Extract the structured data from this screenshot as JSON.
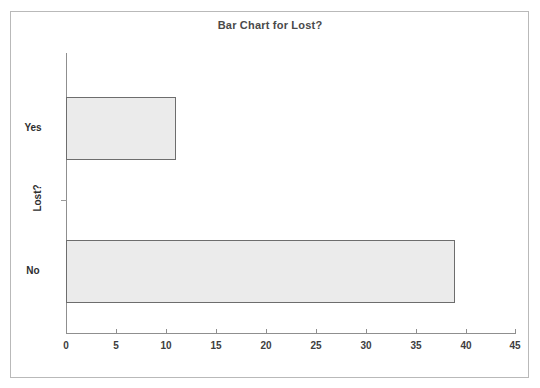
{
  "chart_data": {
    "type": "bar",
    "orientation": "horizontal",
    "title": "Bar Chart for Lost?",
    "xlabel": "",
    "ylabel": "Lost?",
    "categories": [
      "Yes",
      "No"
    ],
    "values": [
      11,
      39
    ],
    "xlim": [
      0,
      45
    ],
    "xticks": [
      0,
      5,
      10,
      15,
      20,
      25,
      30,
      35,
      40,
      45
    ],
    "xtick_labels": [
      "0",
      "5",
      "10",
      "15",
      "20",
      "25",
      "30",
      "35",
      "40",
      "45"
    ],
    "grid": false,
    "legend": null,
    "bar_fill_color": "#ebebeb",
    "bar_edge_color": "#6d6d6d",
    "title_color": "#4a4a4a",
    "axis_color": "#8f8f8f",
    "frame_color": "#b9b9b9",
    "background_color": "#ffffff"
  }
}
